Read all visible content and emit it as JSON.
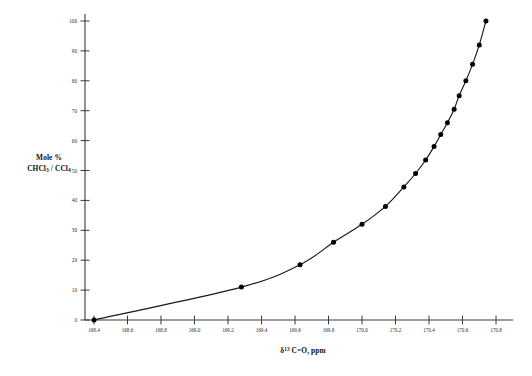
{
  "figure": {
    "background_color": "#ffffff",
    "ink_color": "#1a1a1a",
    "y_axis_title_line1": "Mole %",
    "y_axis_title_line2_prefix": "CHCl",
    "y_axis_title_line2_sub1": "3",
    "y_axis_title_line2_mid": " / CCl",
    "y_axis_title_line2_sub2": "4",
    "x_axis_title_delta": "δ",
    "x_axis_title_sup": "13",
    "x_axis_title_rest": " C=O, ppm"
  },
  "chart_data": {
    "type": "scatter",
    "title": "",
    "subtitle": "",
    "xlabel": "δ13 C=O, ppm",
    "ylabel": "Mole % CHCl3 / CCl4",
    "xlim": [
      168.3,
      170.9
    ],
    "ylim": [
      0,
      100
    ],
    "grid": false,
    "legend": null,
    "x_ticks": [
      168.4,
      168.6,
      168.8,
      169.0,
      169.2,
      169.4,
      169.6,
      169.8,
      170.0,
      170.2,
      170.4,
      170.6,
      170.8
    ],
    "x_tick_labels": [
      "168.4",
      "168.6",
      "168.8",
      "169.0",
      "169.2",
      "169.4",
      "169.6",
      "169.8",
      "170.0",
      "170.2",
      "170.4",
      "170.6",
      "170.8"
    ],
    "y_ticks": [
      0,
      10,
      20,
      30,
      40,
      50,
      60,
      70,
      80,
      90,
      100
    ],
    "y_tick_labels": [
      "0",
      "10",
      "20",
      "30",
      "40",
      "50",
      "60",
      "70",
      "80",
      "90",
      "100"
    ],
    "series": [
      {
        "name": "Mole % CHCl3 in CCl4",
        "marker": "filled-circle",
        "line": "smooth-fit-curve",
        "x": [
          168.4,
          169.28,
          169.63,
          169.83,
          170.0,
          170.14,
          170.25,
          170.32,
          170.38,
          170.43,
          170.47,
          170.51,
          170.55,
          170.58,
          170.62,
          170.66,
          170.7,
          170.74
        ],
        "y": [
          0.0,
          11.0,
          18.5,
          26.0,
          32.0,
          38.0,
          44.5,
          49.0,
          53.5,
          58.0,
          62.0,
          66.0,
          70.5,
          75.0,
          80.0,
          85.5,
          92.0,
          100.0
        ]
      }
    ]
  }
}
